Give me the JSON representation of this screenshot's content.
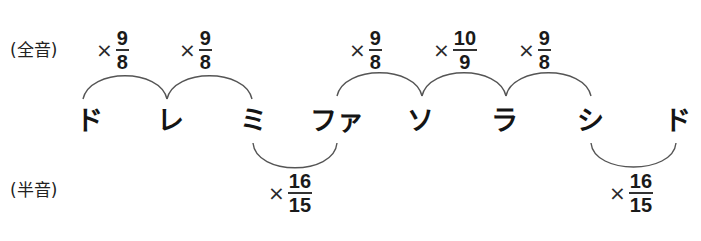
{
  "labels": {
    "whole_tone": "(全音)",
    "half_tone": "(半音)"
  },
  "notes": [
    {
      "name": "ド"
    },
    {
      "name": "レ"
    },
    {
      "name": "ミ"
    },
    {
      "name": "ファ"
    },
    {
      "name": "ソ"
    },
    {
      "name": "ラ"
    },
    {
      "name": "シ"
    },
    {
      "name": "ド"
    }
  ],
  "intervals_whole": [
    {
      "from": "ド",
      "to": "レ",
      "times": "×",
      "numerator": "9",
      "denominator": "8"
    },
    {
      "from": "レ",
      "to": "ミ",
      "times": "×",
      "numerator": "9",
      "denominator": "8"
    },
    {
      "from": "ファ",
      "to": "ソ",
      "times": "×",
      "numerator": "9",
      "denominator": "8"
    },
    {
      "from": "ソ",
      "to": "ラ",
      "times": "×",
      "numerator": "10",
      "denominator": "9"
    },
    {
      "from": "ラ",
      "to": "シ",
      "times": "×",
      "numerator": "9",
      "denominator": "8"
    }
  ],
  "intervals_half": [
    {
      "from": "ミ",
      "to": "ファ",
      "times": "×",
      "numerator": "16",
      "denominator": "15"
    },
    {
      "from": "シ",
      "to": "ド",
      "times": "×",
      "numerator": "16",
      "denominator": "15"
    }
  ],
  "colors": {
    "arc": "#555555",
    "text": "#1a1a1a",
    "background": "#ffffff"
  }
}
